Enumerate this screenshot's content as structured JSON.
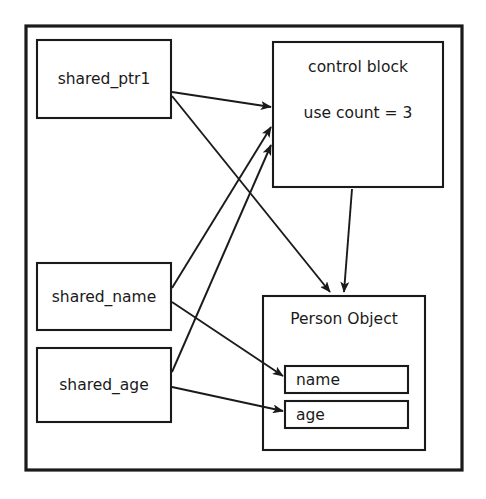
{
  "diagram": {
    "frame": {
      "name": "outer-frame"
    },
    "colors": {
      "stroke": "#1a1a1a",
      "background": "#ffffff",
      "text": "#1a1a1a"
    },
    "nodes": [
      {
        "id": "shared_ptr1",
        "label": "shared_ptr1",
        "x": 37,
        "y": 40,
        "w": 134,
        "h": 78
      },
      {
        "id": "shared_name",
        "label": "shared_name",
        "x": 37,
        "y": 263,
        "w": 134,
        "h": 67
      },
      {
        "id": "shared_age",
        "label": "shared_age",
        "x": 37,
        "y": 348,
        "w": 134,
        "h": 74
      },
      {
        "id": "control_block",
        "label": "control block",
        "x": 273,
        "y": 42,
        "w": 170,
        "h": 145
      },
      {
        "id": "person_object",
        "label": "Person Object",
        "x": 263,
        "y": 296,
        "w": 162,
        "h": 154
      }
    ],
    "control_block": {
      "title": "control block",
      "use_count_label": "use count = 3",
      "use_count_value": 3
    },
    "person_object": {
      "title": "Person Object",
      "fields": [
        {
          "id": "name",
          "label": "name",
          "x": 285,
          "y": 366,
          "w": 123,
          "h": 27
        },
        {
          "id": "age",
          "label": "age",
          "x": 285,
          "y": 401,
          "w": 123,
          "h": 27
        }
      ]
    },
    "edges": [
      {
        "id": "ptr1-to-control",
        "from": "shared_ptr1",
        "to": "control_block",
        "arrow": true
      },
      {
        "id": "ptr1-to-person",
        "from": "shared_ptr1",
        "to": "person_object",
        "arrow": true
      },
      {
        "id": "name-to-control",
        "from": "shared_name",
        "to": "control_block",
        "arrow": true
      },
      {
        "id": "name-to-field",
        "from": "shared_name",
        "to": "name",
        "arrow": true
      },
      {
        "id": "age-to-control",
        "from": "shared_age",
        "to": "control_block",
        "arrow": true
      },
      {
        "id": "age-to-field",
        "from": "shared_age",
        "to": "age",
        "arrow": true
      },
      {
        "id": "control-to-person",
        "from": "control_block",
        "to": "person_object",
        "arrow": true
      }
    ]
  }
}
